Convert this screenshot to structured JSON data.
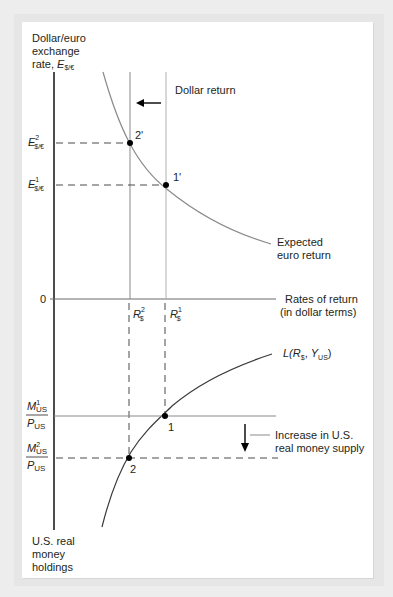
{
  "diagram": {
    "top_panel": {
      "y_axis_label": [
        "Dollar/euro",
        "exchange",
        "rate,"
      ],
      "y_axis_symbol": "E",
      "y_axis_symbol_sub": "$/€",
      "x_axis_label": [
        "Rates of return",
        "(in dollar terms)"
      ],
      "origin_label": "0",
      "dollar_return_label": "Dollar return",
      "expected_euro_return_label": [
        "Expected",
        "euro return"
      ],
      "e2_label": {
        "main": "E",
        "sup": "2",
        "sub": "$/€"
      },
      "e1_label": {
        "main": "E",
        "sup": "1",
        "sub": "$/€"
      },
      "point_2prime": "2'",
      "point_1prime": "1'",
      "r2_label": {
        "main": "R",
        "sup": "2",
        "sub": "$"
      },
      "r1_label": {
        "main": "R",
        "sup": "1",
        "sub": "$"
      }
    },
    "bottom_panel": {
      "liquidity_label": {
        "prefix": "L(",
        "r": "R",
        "r_sub": "$",
        "comma": ", ",
        "y": "Y",
        "y_sub": "US",
        "suffix": ")"
      },
      "m1_label": {
        "num": "M",
        "num_sup": "1",
        "num_sub": "US",
        "den": "P",
        "den_sub": "US"
      },
      "m2_label": {
        "num": "M",
        "num_sup": "2",
        "num_sub": "US",
        "den": "P",
        "den_sub": "US"
      },
      "point_1": "1",
      "point_2": "2",
      "increase_label": [
        "Increase in U.S.",
        "real money supply"
      ],
      "y_axis_label": [
        "U.S. real",
        "money",
        "holdings"
      ]
    },
    "colors": {
      "axis": "#231f20",
      "curve_gray": "#8a8a8a",
      "curve_dark": "#3a3a3a",
      "dashed": "#4a4a4a",
      "dot": "#000000"
    }
  }
}
